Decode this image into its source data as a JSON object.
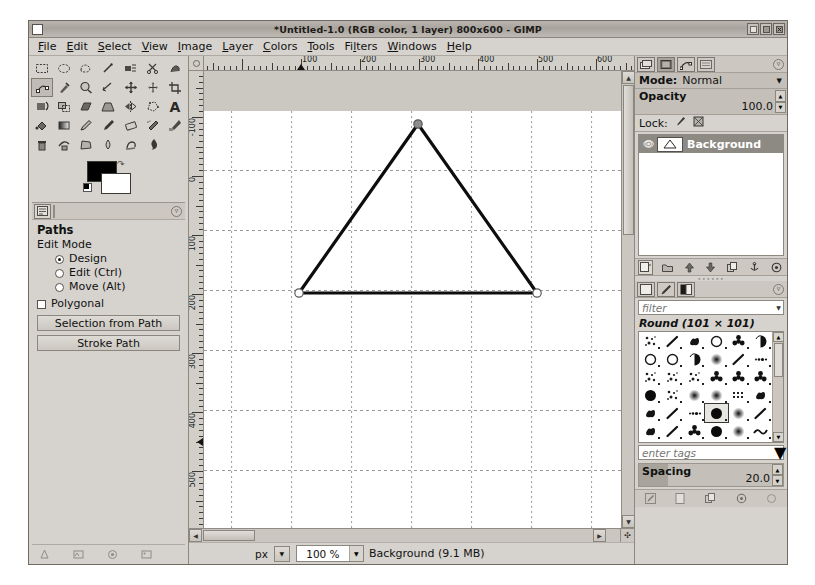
{
  "window": {
    "title": "*Untitled-1.0 (RGB color, 1 layer) 800x600 - GIMP",
    "minimize_label": "_",
    "maximize_label": "□",
    "close_label": "×"
  },
  "menubar": {
    "items": [
      {
        "label": "File",
        "accel": "F"
      },
      {
        "label": "Edit",
        "accel": "E"
      },
      {
        "label": "Select",
        "accel": "S"
      },
      {
        "label": "View",
        "accel": "V"
      },
      {
        "label": "Image",
        "accel": "I"
      },
      {
        "label": "Layer",
        "accel": "L"
      },
      {
        "label": "Colors",
        "accel": "C"
      },
      {
        "label": "Tools",
        "accel": "T"
      },
      {
        "label": "Filters",
        "accel": "F"
      },
      {
        "label": "Windows",
        "accel": "W"
      },
      {
        "label": "Help",
        "accel": "H"
      }
    ]
  },
  "toolbox": {
    "tools": [
      "rect-select-icon",
      "ellipse-select-icon",
      "free-select-icon",
      "fuzzy-select-icon",
      "select-by-color-icon",
      "scissors-select-icon",
      "foreground-select-icon",
      "paths-icon",
      "color-picker-icon",
      "zoom-icon",
      "measure-icon",
      "move-icon",
      "alignment-icon",
      "crop-icon",
      "rotate-icon",
      "scale-icon",
      "shear-icon",
      "perspective-icon",
      "flip-icon",
      "cage-transform-icon",
      "text-icon",
      "bucket-fill-icon",
      "blend-icon",
      "pencil-icon",
      "paintbrush-icon",
      "eraser-icon",
      "airbrush-icon",
      "ink-icon",
      "clone-icon",
      "heal-icon",
      "perspective-clone-icon",
      "blur-sharpen-icon",
      "smudge-icon",
      "dodge-burn-icon"
    ],
    "selected_tool": "paths-icon",
    "foreground_color": "#000000",
    "background_color": "#ffffff",
    "swap_colors_label": "swap-colors-icon",
    "bottom_icons": [
      "brush-indicator-icon",
      "pattern-indicator-icon",
      "gradient-indicator-icon",
      "image-indicator-icon"
    ]
  },
  "tool_options": {
    "tab_icon": "tool-options-icon",
    "menu_icon": "dock-menu-icon",
    "title": "Paths",
    "edit_mode_label": "Edit Mode",
    "modes": [
      {
        "label": "Design",
        "selected": true
      },
      {
        "label": "Edit (Ctrl)",
        "selected": false
      },
      {
        "label": "Move (Alt)",
        "selected": false
      }
    ],
    "polygonal_label": "Polygonal",
    "polygonal_checked": false,
    "buttons": [
      {
        "label": "Selection from Path"
      },
      {
        "label": "Stroke Path"
      }
    ]
  },
  "canvas": {
    "image_width": 800,
    "image_height": 600,
    "h_ruler_labels": [
      "100",
      "200",
      "300",
      "400",
      "500",
      "600",
      "700"
    ],
    "v_ruler_labels": [
      "-100",
      "0",
      "100",
      "200",
      "300",
      "400",
      "500",
      "600"
    ],
    "grid_spacing_px": 60,
    "path_name": "triangle-path",
    "path_points": [
      {
        "x": 214,
        "y": 13,
        "label": "apex-anchor"
      },
      {
        "x": 95,
        "y": 182,
        "label": "bottom-left-anchor"
      },
      {
        "x": 333,
        "y": 182,
        "label": "bottom-right-anchor"
      }
    ],
    "pointer_x_marker": 100,
    "pointer_y_marker": 450
  },
  "statusbar": {
    "unit": "px",
    "unit_arrow": "▼",
    "zoom": "100 %",
    "zoom_arrow": "▼",
    "status_text": "Background (9.1 MB)",
    "navigate_icon": "navigate-canvas-icon"
  },
  "layers_dock": {
    "tabs": [
      "layers-tab-icon",
      "channels-tab-icon",
      "paths-tab-icon",
      "undo-history-tab-icon"
    ],
    "active_tab_index": 0,
    "menu_icon": "dock-menu-icon",
    "mode_label": "Mode:",
    "mode_value": "Normal",
    "mode_arrow": "▼",
    "opacity_label": "Opacity",
    "opacity_value": "100.0",
    "lock_label": "Lock:",
    "lock_icons": [
      "lock-pixels-icon",
      "lock-alpha-icon"
    ],
    "layers": [
      {
        "name": "Background",
        "visible": true,
        "selected": true,
        "eye_icon": "eye-icon"
      }
    ],
    "toolbar_icons": [
      "new-layer-icon",
      "new-layer-group-icon",
      "raise-layer-icon",
      "lower-layer-icon",
      "duplicate-layer-icon",
      "anchor-layer-icon",
      "delete-layer-icon"
    ]
  },
  "brushes_dock": {
    "tabs": [
      "brushes-tab-icon",
      "patterns-tab-icon",
      "gradients-tab-icon"
    ],
    "menu_icon": "dock-menu-icon",
    "filter_placeholder": "filter",
    "filter_value": "",
    "filter_arrow": "▼",
    "selected_brush": "Round (101 × 101)",
    "brush_count": 36,
    "tags_placeholder": "enter tags",
    "tags_value": "",
    "tags_arrow": "▼",
    "spacing_label": "Spacing",
    "spacing_value": "20.0",
    "toolbar_icons": [
      "edit-brush-icon",
      "new-brush-icon",
      "duplicate-brush-icon",
      "delete-brush-icon",
      "refresh-brushes-icon"
    ]
  },
  "colors": {
    "window_bg": "#d6d3ce",
    "canvas_bg": "#ffffff",
    "path_stroke": "#0d0d0d",
    "selected_layer_bg": "#8d8a83"
  }
}
